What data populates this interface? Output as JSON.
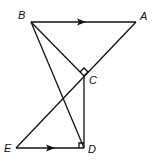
{
  "diagram": {
    "points": {
      "A": {
        "label": "A",
        "x": 136,
        "y": 22
      },
      "B": {
        "label": "B",
        "x": 31,
        "y": 22
      },
      "C": {
        "label": "C",
        "x": 84,
        "y": 76
      },
      "D": {
        "label": "D",
        "x": 84,
        "y": 148
      },
      "E": {
        "label": "E",
        "x": 16,
        "y": 148
      }
    },
    "segments": [
      "BA",
      "AE",
      "BC",
      "BD",
      "CD",
      "ED"
    ],
    "parallel_marks": [
      "BA",
      "ED"
    ],
    "right_angles": [
      "BCA",
      "CDE"
    ],
    "stroke_color": "#111111"
  }
}
